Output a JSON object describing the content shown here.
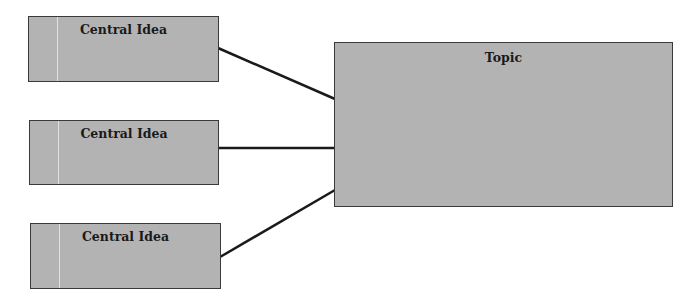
{
  "diagram": {
    "type": "concept-map",
    "colors": {
      "box_fill": "#b3b3b3",
      "box_border": "#3a3a3a",
      "connector": "#1a1a1a",
      "background": "#ffffff"
    },
    "topic": {
      "label": "Topic"
    },
    "central_ideas": [
      {
        "label": "Central Idea"
      },
      {
        "label": "Central Idea"
      },
      {
        "label": "Central Idea"
      }
    ]
  }
}
